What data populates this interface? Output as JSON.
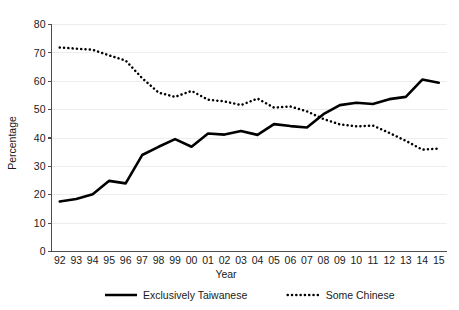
{
  "chart_data": {
    "type": "line",
    "title": "",
    "xlabel": "Year",
    "ylabel": "Percentage",
    "ylim": [
      0,
      80
    ],
    "yticks": [
      0,
      10,
      20,
      30,
      40,
      50,
      60,
      70,
      80
    ],
    "ytick_labels": [
      "0",
      "10",
      "20",
      "30",
      "40",
      "50",
      "60",
      "70",
      "80"
    ],
    "grid": true,
    "grid_axis": "y",
    "legend_position": "bottom",
    "categories": [
      "92",
      "93",
      "94",
      "95",
      "96",
      "97",
      "98",
      "99",
      "00",
      "01",
      "02",
      "03",
      "04",
      "05",
      "06",
      "07",
      "08",
      "09",
      "10",
      "11",
      "12",
      "13",
      "14",
      "15"
    ],
    "series": [
      {
        "name": "Exclusively Taiwanese",
        "style": "solid",
        "color": "#000000",
        "values": [
          17.6,
          18.5,
          20.2,
          24.9,
          24.0,
          34.0,
          36.9,
          39.6,
          36.9,
          41.6,
          41.2,
          42.5,
          41.1,
          44.9,
          44.2,
          43.7,
          48.4,
          51.6,
          52.4,
          52.0,
          53.7,
          54.5,
          60.6,
          59.5
        ]
      },
      {
        "name": "Some Chinese",
        "style": "dotted",
        "color": "#000000",
        "values": [
          71.9,
          71.5,
          71.1,
          69.1,
          67.3,
          61.1,
          56.0,
          54.5,
          56.6,
          53.5,
          52.9,
          51.6,
          53.9,
          50.7,
          51.1,
          49.4,
          46.7,
          44.8,
          44.1,
          44.4,
          41.8,
          39.0,
          35.9,
          36.3
        ]
      }
    ]
  },
  "axes": {
    "y_title": "Percentage",
    "x_title": "Year"
  },
  "legend": {
    "items": [
      {
        "label": "Exclusively Taiwanese",
        "style": "solid"
      },
      {
        "label": "Some Chinese",
        "style": "dotted"
      }
    ]
  }
}
